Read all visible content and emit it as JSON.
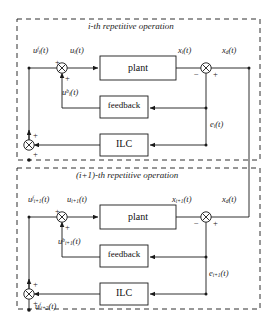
{
  "figure": {
    "type": "block-diagram",
    "background": "#ffffff",
    "line_color": "#1a1a1a",
    "text_color": "#1a1a1a",
    "width": 277,
    "height": 327
  },
  "panels": [
    {
      "id": "panel-i",
      "title": "i-th repetitive operation",
      "border_style": "dashed",
      "blocks": [
        {
          "id": "plant-i",
          "label": "plant"
        },
        {
          "id": "feedback-i",
          "label": "feedback"
        },
        {
          "id": "ilc-i",
          "label": "ILC"
        }
      ],
      "signals": [
        {
          "id": "u-ff-i",
          "text": "u",
          "sub": "i",
          "sup": "f",
          "arg": "(t)",
          "full": "u_i^f(t)"
        },
        {
          "id": "u-i",
          "text": "u",
          "sub": "i",
          "sup": "",
          "arg": "(t)",
          "full": "u_i(t)"
        },
        {
          "id": "u-fb-i",
          "text": "u",
          "sub": "i",
          "sup": "b",
          "arg": "(t)",
          "full": "u_i^b(t)"
        },
        {
          "id": "x-i",
          "text": "x",
          "sub": "i",
          "sup": "",
          "arg": "(t)",
          "full": "x_i(t)"
        },
        {
          "id": "x-d-top",
          "text": "x",
          "sub": "d",
          "sup": "",
          "arg": "(t)",
          "full": "x_d(t)"
        },
        {
          "id": "e-i",
          "text": "e",
          "sub": "i",
          "sup": "",
          "arg": "(t)",
          "full": "e_i(t)"
        }
      ],
      "junctions": [
        {
          "id": "sum-input-i",
          "signs": [
            "+",
            "+"
          ]
        },
        {
          "id": "sum-error-i",
          "signs": [
            "−",
            "+"
          ]
        },
        {
          "id": "sum-learn-i",
          "signs": [
            "+",
            "+"
          ]
        }
      ]
    },
    {
      "id": "panel-i1",
      "title": "(i+1)-th repetitive operation",
      "border_style": "dashed",
      "blocks": [
        {
          "id": "plant-i1",
          "label": "plant"
        },
        {
          "id": "feedback-i1",
          "label": "feedback"
        },
        {
          "id": "ilc-i1",
          "label": "ILC"
        }
      ],
      "signals": [
        {
          "id": "u-ff-i1",
          "text": "u",
          "sub": "i+1",
          "sup": "f",
          "arg": "(t)",
          "full": "u_{i+1}^f(t)"
        },
        {
          "id": "u-i1",
          "text": "u",
          "sub": "i+1",
          "sup": "",
          "arg": "(t)",
          "full": "u_{i+1}(t)"
        },
        {
          "id": "u-fb-i1",
          "text": "u",
          "sub": "i+1",
          "sup": "b",
          "arg": "(t)",
          "full": "u_{i+1}^b(t)"
        },
        {
          "id": "x-i1",
          "text": "x",
          "sub": "i+1",
          "sup": "",
          "arg": "(t)",
          "full": "x_{i+1}(t)"
        },
        {
          "id": "x-d-bot",
          "text": "x",
          "sub": "d",
          "sup": "",
          "arg": "(t)",
          "full": "x_d(t)"
        },
        {
          "id": "e-i1",
          "text": "e",
          "sub": "i+1",
          "sup": "",
          "arg": "(t)",
          "full": "e_{i+1}(t)"
        },
        {
          "id": "u-ff-i2",
          "text": "u",
          "sub": "i+2",
          "sup": "f",
          "arg": "(t)",
          "full": "u_{i+2}^f(t)"
        }
      ],
      "junctions": [
        {
          "id": "sum-input-i1",
          "signs": [
            "+",
            "+"
          ]
        },
        {
          "id": "sum-error-i1",
          "signs": [
            "−",
            "+"
          ]
        },
        {
          "id": "sum-learn-i1",
          "signs": [
            "+",
            "+"
          ]
        }
      ]
    }
  ]
}
